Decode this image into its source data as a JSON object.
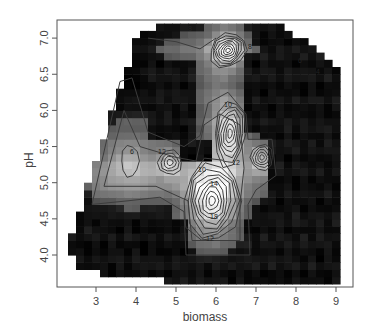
{
  "chart_data": {
    "type": "heatmap",
    "subtype": "filled image with contour overlay",
    "title": "",
    "xlabel": "biomass",
    "ylabel": "pH",
    "xlim": [
      2.3,
      9.4
    ],
    "ylim": [
      3.55,
      7.2
    ],
    "x_ticks": [
      3,
      4,
      5,
      6,
      7,
      8,
      9
    ],
    "x_tick_labels": [
      "3",
      "4",
      "5",
      "6",
      "7",
      "8",
      "9"
    ],
    "y_ticks": [
      4.0,
      4.5,
      5.0,
      5.5,
      6.0,
      6.5,
      7.0
    ],
    "y_tick_labels": [
      "4.0",
      "4.5",
      "5.0",
      "5.5",
      "6.0",
      "6.5",
      "7.0"
    ],
    "colormap": "grayscale (black = low, white = high)",
    "grid": false,
    "legend": null,
    "contour_levels_labeled": [
      6,
      8,
      10,
      12,
      14,
      16,
      18
    ],
    "peaks": [
      {
        "biomass": 5.9,
        "pH": 4.8,
        "approx_value": 20,
        "label": "18"
      },
      {
        "biomass": 6.4,
        "pH": 5.7,
        "approx_value": 16,
        "label": "10"
      },
      {
        "biomass": 6.3,
        "pH": 6.85,
        "approx_value": 16,
        "label": "8"
      },
      {
        "biomass": 7.1,
        "pH": 5.35,
        "approx_value": 12,
        "label": "8"
      },
      {
        "biomass": 4.8,
        "pH": 5.3,
        "approx_value": 12,
        "label": "12"
      },
      {
        "biomass": 3.8,
        "pH": 5.3,
        "approx_value": 6,
        "label": "6"
      },
      {
        "biomass": 8.1,
        "pH": 6.65,
        "approx_value": 6,
        "label": "6"
      }
    ],
    "contour_labels_visible": [
      {
        "text": "6",
        "biomass": 3.9,
        "pH": 5.4
      },
      {
        "text": "12",
        "biomass": 4.65,
        "pH": 5.4
      },
      {
        "text": "10",
        "biomass": 6.3,
        "pH": 6.05
      },
      {
        "text": "10",
        "biomass": 5.65,
        "pH": 5.15
      },
      {
        "text": "14",
        "biomass": 5.95,
        "pH": 4.95
      },
      {
        "text": "18",
        "biomass": 5.95,
        "pH": 4.5
      },
      {
        "text": "12",
        "biomass": 5.85,
        "pH": 4.2
      },
      {
        "text": "8",
        "biomass": 5.35,
        "pH": 7.1
      },
      {
        "text": "8",
        "biomass": 6.85,
        "pH": 6.85
      },
      {
        "text": "6",
        "biomass": 8.1,
        "pH": 6.65
      },
      {
        "text": "4",
        "biomass": 8.55,
        "pH": 6.5
      },
      {
        "text": "12",
        "biomass": 6.5,
        "pH": 5.25
      }
    ]
  },
  "axes": {
    "xlabel": "biomass",
    "ylabel": "pH"
  }
}
